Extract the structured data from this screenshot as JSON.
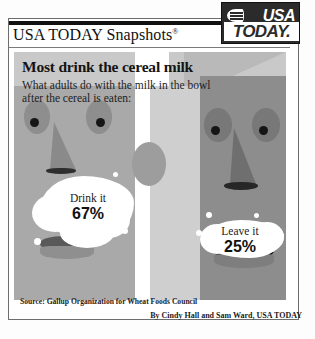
{
  "brand": {
    "snapshots_title": "USA TODAY Snapshots",
    "registered_mark": "®",
    "logo_line1": "USA",
    "logo_line2": "TODAY.",
    "logo_icon": "globe-swoosh-icon"
  },
  "headline": "Most drink the cereal milk",
  "subtitle": "What adults do with the milk in the bowl after the cereal is eaten:",
  "labels": [
    {
      "caption": "Drink it",
      "value": "67%"
    },
    {
      "caption": "Leave it",
      "value": "25%"
    }
  ],
  "source": "Source: Gallup Organization for Wheat Foods Council",
  "credit": "By Cindy Hall and Sam Ward, USA TODAY",
  "colors": {
    "logo_background": "#2b2b2b",
    "panel_background": "#c9c9c9",
    "face_left": "#a9a9a9",
    "face_right": "#8d8d8d",
    "milk": "#ffffff",
    "text": "#141414"
  },
  "chart_data": {
    "type": "bar",
    "title": "Most drink the cereal milk",
    "subtitle": "What adults do with the milk in the bowl after the cereal is eaten:",
    "categories": [
      "Drink it",
      "Leave it"
    ],
    "values": [
      67,
      25
    ],
    "xlabel": "",
    "ylabel": "Percent of adults",
    "ylim": [
      0,
      100
    ],
    "grid": false,
    "legend": false,
    "annotations": [
      "Source: Gallup Organization for Wheat Foods Council"
    ]
  }
}
